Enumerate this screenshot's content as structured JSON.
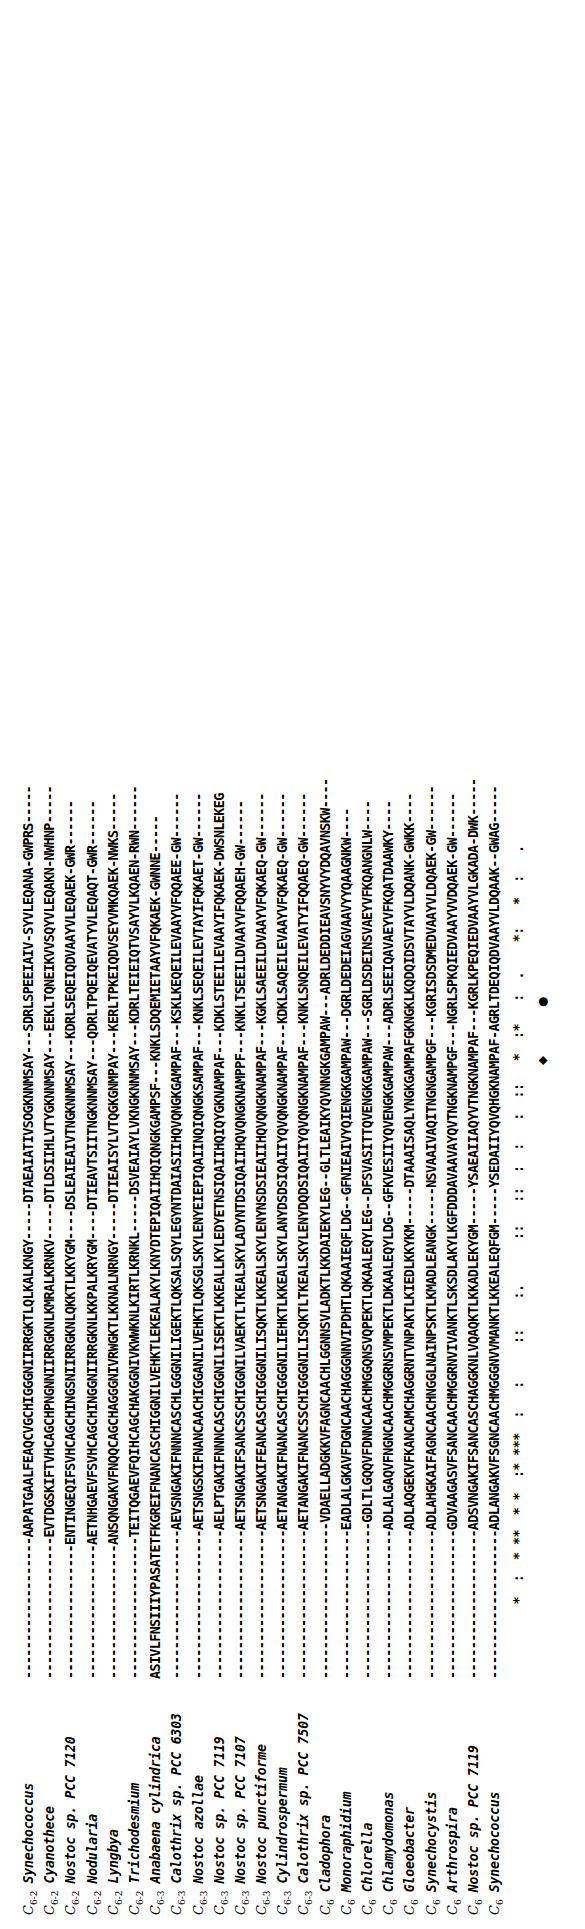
{
  "figure": {
    "type": "multiple-sequence-alignment",
    "orientation": "rotated-90-ccw",
    "gap_char": "-",
    "conservation_symbols": {
      "identical": "*",
      "strongly_similar": ":",
      "weakly_similar": "."
    },
    "marker_glyphs": {
      "heme_iron_ligand_his": "●",
      "heme_iron_ligand_met": "◆"
    }
  },
  "alignment": {
    "rows": [
      {
        "group": "C",
        "group_sub": "6-2",
        "organism": "Synechococcus",
        "sequence": "-------------------AAPATGAALFEAQCVGCHIGGGNIIRRGKTLQLKALKNGY-----DTAEAIATIVSOGKNNMSAY---SDRLSPEEIAIV-SYVLEQANA-GWPRS-----"
      },
      {
        "group": "C",
        "group_sub": "6-2",
        "organism": "Cyanothece",
        "sequence": "-------------------EVTDGSKIFTVHCAGCHPNGNNIIRRGKNLKMRALKRNKV-----DTLDSIIHLVTYGKNNMSAY---EEKLTQNEIKVVSQYVLEQAKN-NWHNP-----"
      },
      {
        "group": "C",
        "group_sub": "6-2",
        "organism": "Nostoc sp. PCC 7120",
        "sequence": "------------------ENTINGEQIFSVHCAGCHINGSNIIRRGKNLQKKTLKKYGM----DSLEAIEAIVTNGKNNMSAY---KDRLSEQEIQDVAAYVLEQAEK-GWR------"
      },
      {
        "group": "C",
        "group_sub": "6-2",
        "organism": "Nodularia",
        "sequence": "------------------AETNHGAEVFSVHCAGCHINGGNIIRRGKNLKKPALKRYGM----DTIEAVTSIITNGKNNMSAY---QDRLTPQEIQEVATYVLEQAQT-GWR------"
      },
      {
        "group": "C",
        "group_sub": "6-2",
        "organism": "Lyngbya",
        "sequence": "------------------ANSQNGAKVFNQQCAGCHAGGGNIVRWGKTLKKNALNRNGY-----DTIEAISYLVTQGKGNMPAY---KERLTPKEIQDVSEYVMKQAEK-NWKS-----"
      },
      {
        "group": "C",
        "group_sub": "6-2",
        "organism": "Trichodesmium",
        "sequence": "-------------------TEITQGAEVFQIHCAGCHAKGGNIVKWWKNLKIRTLKRNKL-----DSVEAIAYLVKNGKNNMSAY---KDRLTEIEIQTVSAYVLKQAEN-RWN------"
      },
      {
        "group": "C",
        "group_sub": "6-3",
        "organism": "Anabaena cylindrica",
        "sequence": "ASIVLFNSIIIYPASATETFKGREIFNANCASCHIGGNILVEHKTLEKEALAKYLKNYDTEPIQAIIHQIQNGKGAMPSF---KNKLSDQEMIETAAYVFQKAEK-GWNNE-----"
      },
      {
        "group": "C",
        "group_sub": "6-3",
        "organism": "Calothrix sp. PCC 6303",
        "sequence": "--------------------AEVSNGAKIFNNNCASCHLGGGNILIGEKTLQKSALSQYLEGYNTDAIASIIHQVQNGKGAMPAF---KSKLKEQEILEVAAYVFQQAEE-GW------"
      },
      {
        "group": "C",
        "group_sub": "6-3",
        "organism": "Nostoc azollae",
        "sequence": "--------------------AETSNGSKIFNANCAACHIGGANILVEHKTLQKSGLSKYLENYEIEPIQAIINQIQNGKSAMPAF---KNKLSEQEILEVTAYIFQKAET-GW------"
      },
      {
        "group": "C",
        "group_sub": "6-3",
        "organism": "Nostoc sp. PCC 7119",
        "sequence": "--------------------AELPTGAKIFNNNCASCHIGGNILISEKTLKKEALLKYLEDYETNSIQAIIHQIQYGKNAMPAF---KDKLSTEEILEVAAYIFQKAEK-DWSNLEKEG"
      },
      {
        "group": "C",
        "group_sub": "6-3",
        "organism": "Nostoc sp. PCC 7107",
        "sequence": "--------------------AETSNGAKIFSANCSSCHIGGNILVAEKTLTKEALSKYLADYNTDSIQAIIHQVQNGKNAMPPF---KNKLTSEEILDVAAYVFQQAEH-GW------"
      },
      {
        "group": "C",
        "group_sub": "6-3",
        "organism": "Nostoc punctiforme",
        "sequence": "--------------------AETSNGAKIFEANCASCHIGGGNILISQKTLKKEALSKYLENYNSDSIEAIIHQVQNGKNAMPAF---KGKLSAEEILDVAAYVFQKAEQ-GW------"
      },
      {
        "group": "C",
        "group_sub": "6-3",
        "organism": "Cylindrospermum",
        "sequence": "--------------------AETANGAKIFNANCASCHIGGGNILIEHKTLKKEALSKYLANYDSDSIQAIIYQVQNGKNAMPAF---KDKLSAQEILEVAAYVFQKAEQ-GW------"
      },
      {
        "group": "C",
        "group_sub": "6-3",
        "organism": "Calothrix sp. PCC 7507",
        "sequence": "--------------------AETANGAKIFNANCSSCHIGGGNILISQKTLTKEALSKYLENYDQDSIQAIIYQVQNGKNAMPAF---KNKLSNQEILEVATYIFQQAEQ-GW------"
      },
      {
        "group": "C",
        "group_sub": "6",
        "organism": "Cladophora",
        "sequence": "---------------------VDAELLADGKKVFAGNCAACHLGGNNSVLADKTLKKDAIEKYLEG--GLTLEAIKYQVNNGKGAMPAW---ADRLDEDDIEAVSNYVYDQAVNSKW----"
      },
      {
        "group": "C",
        "group_sub": "6",
        "organism": "Monoraphidium",
        "sequence": "--------------------EADLALGKAVFDGNCAACHAGGGNNVIPDHTLQKAAIEQFLDG--GFNIEAIVYQIENGKGAMPAW---DGRLDEDEIAGVAAVYYQAAGNKW----"
      },
      {
        "group": "C",
        "group_sub": "6",
        "organism": "Chlorella",
        "sequence": "---------------------GDLTLGQQVFDNNCAACHMGGQNSVQPEKTLQKAALEQYLEG--DFSVASITTQVENGKGAMPAW---SGRLDSDEINSVAEYVFKQANGNLW----"
      },
      {
        "group": "C",
        "group_sub": "6",
        "organism": "Chlamydomonas",
        "sequence": "--------------------ADLALGAQVFNGNCAACHMGGRNSVMPEKTLDKAALEQYLDG--GFKVESIIYQVENGKGAMPAW---ADRLSEEIQAVAEYVFKQATDAAWKY----"
      },
      {
        "group": "C",
        "group_sub": "6",
        "organism": "Gloeobacter",
        "sequence": "--------------------ADLAQGEKVFKANCAMCHAGGRNTVNPAKTLKIEDLKKYKM-----DTAAAISAQLYNGKGAMPAFGKNGKLKQDQIDSVTAYVLDQANK-GWKK----"
      },
      {
        "group": "C",
        "group_sub": "6",
        "organism": "Synechocystis",
        "sequence": "--------------------ADLAHGKAIFAGNCAACHNGGLNAINPSKTLKMADLEANGK-----NSVAAIVAQITNGNGAMPGF---KGRISDSDMEDVAAYVLDQAEK-GW------"
      },
      {
        "group": "C",
        "group_sub": "6",
        "organism": "Arthrospira",
        "sequence": "--------------------GDVAAGASVFSANCAACHMGGRNVIVANKTLSKSDLAKYLKGFDDDAVAAVAYQVTNGKNAMPGF---NGRLSPKQIEDVAAYVVDQAEK-GW------"
      },
      {
        "group": "C",
        "group_sub": "6",
        "organism": "Nostoc sp. PCC 7119",
        "sequence": "--------------------ADSVNGAKIFSANCASCHAGGKNLVQAQKTLKKADLEKYGM-----YSAEAIIAQYVTNGKNAMPAF---KGRLKPEQIEDVAAYVLGKADA-DWK-----"
      },
      {
        "group": "C",
        "group_sub": "6",
        "organism": "Synechococcus",
        "sequence": "--------------------ADLANGAKVFSGNCAACHMGGGNVVMANKTLKKEALEQFGM-----YSEDAIIYQVQHGKNAMPAF-AGRLTDEQIQDVAAYVLDQAAK--GWAG-----"
      }
    ],
    "conservation_line": "          *  :  * **  * *  :* ***  :   :     ::    :.      ::   ::  :  :   :  ::   *  :*   :  .    *:   *  :   .        ",
    "marker_line": "                                                                         ◆      ●                                        "
  }
}
